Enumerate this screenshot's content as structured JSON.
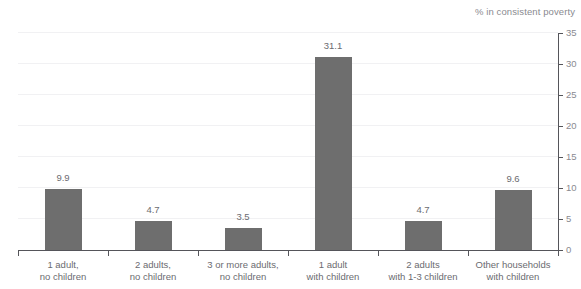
{
  "chart_data": {
    "type": "bar",
    "title": "",
    "clipped_title_sliver": "",
    "unit_caption": "% in consistent poverty",
    "categories": [
      "1 adult, no children",
      "2 adults, no children",
      "3 or more adults, no children",
      "1 adult with children",
      "2 adults with 1-3 children",
      "Other households with children"
    ],
    "category_lines": [
      [
        "1 adult,",
        "no children"
      ],
      [
        "2 adults,",
        "no children"
      ],
      [
        "3 or more adults,",
        "no children"
      ],
      [
        "1 adult",
        "with children"
      ],
      [
        "2 adults",
        "with 1-3 children"
      ],
      [
        "Other households",
        "with children"
      ]
    ],
    "values": [
      9.9,
      4.7,
      3.5,
      31.1,
      4.7,
      9.6
    ],
    "value_labels": [
      "9.9",
      "4.7",
      "3.5",
      "31.1",
      "4.7",
      "9.6"
    ],
    "xlabel": "",
    "ylabel": "% in consistent poverty",
    "ylim": [
      0,
      35
    ],
    "yticks": [
      0,
      5,
      10,
      15,
      20,
      25,
      30,
      35
    ],
    "ytick_labels": [
      "0",
      "5",
      "10",
      "15",
      "20",
      "25",
      "30",
      "35"
    ],
    "y_axis_position": "right",
    "grid": true,
    "grid_axis": "y",
    "legend": false,
    "bar_color": "#6e6e6e",
    "grid_color": "#f1f1f3",
    "axis_color": "#55555a",
    "text_color": "#6b6b70",
    "background": "#ffffff"
  }
}
